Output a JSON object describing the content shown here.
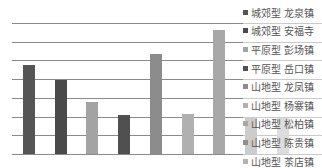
{
  "chart_data": {
    "type": "bar",
    "title": "",
    "xlabel": "",
    "ylabel": "",
    "ylim": [
      0,
      70
    ],
    "grid": true,
    "legend_position": "right",
    "categories": [
      "城郊型 龙泉镇",
      "城郊型 安福寺",
      "平原型 彭场镇",
      "平原型 岳口镇",
      "山地型 龙凤镇",
      "山地型 杨寨镇",
      "山地型 松柏镇",
      "山地型 陈贵镇",
      "山地型 茶店镇"
    ],
    "values": [
      47.5,
      39.5,
      28,
      21,
      53.5,
      21.5,
      66,
      19.5,
      19.5
    ],
    "colors": [
      "#555555",
      "#4a4a4a",
      "#a3a3a3",
      "#505050",
      "#8c8c8c",
      "#b0b0b0",
      "#a8a8a8",
      "#8f8f8f",
      "#b3b3b3"
    ]
  },
  "legend": [
    {
      "label": "城郊型 龙泉镇",
      "color": "#555555"
    },
    {
      "label": "城郊型 安福寺",
      "color": "#4a4a4a"
    },
    {
      "label": "平原型 彭场镇",
      "color": "#a3a3a3"
    },
    {
      "label": "平原型 岳口镇",
      "color": "#505050"
    },
    {
      "label": "山地型 龙凤镇",
      "color": "#8c8c8c"
    },
    {
      "label": "山地型 杨寨镇",
      "color": "#b0b0b0"
    },
    {
      "label": "山地型 松柏镇",
      "color": "#a8a8a8"
    },
    {
      "label": "山地型 陈贵镇",
      "color": "#8f8f8f"
    },
    {
      "label": "山地型 茶店镇",
      "color": "#b3b3b3"
    }
  ]
}
